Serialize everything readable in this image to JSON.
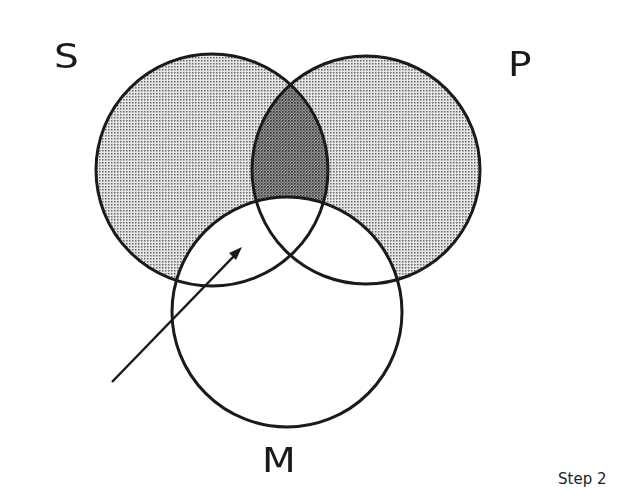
{
  "diagram": {
    "type": "venn-3-circle",
    "labels": {
      "s": "S",
      "p": "P",
      "m": "M"
    },
    "caption": "Step 2",
    "circles": [
      {
        "name": "S",
        "cx": 212,
        "cy": 170,
        "r": 116
      },
      {
        "name": "P",
        "cx": 366,
        "cy": 170,
        "r": 114
      },
      {
        "name": "M",
        "cx": 287,
        "cy": 312,
        "r": 115
      }
    ],
    "shading": {
      "light": "S and P regions outside M",
      "dark": "S∩P outside M"
    },
    "arrow": {
      "from": [
        112,
        382
      ],
      "to": [
        242,
        248
      ],
      "points_to": "S∩M region"
    },
    "colors": {
      "stroke": "#1a1a1a",
      "light_shade": "#bdbdbd",
      "dark_shade": "#7a7a7a",
      "background": "#ffffff"
    }
  }
}
